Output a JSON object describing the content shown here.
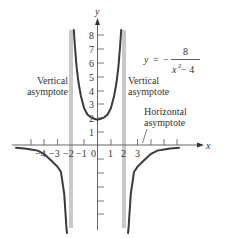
{
  "figure": {
    "equation": {
      "lhs": "y",
      "equals": "=",
      "sign": "−",
      "numerator": "8",
      "denominator_base": "x",
      "denominator_exp": "2",
      "denominator_rest": " − 4"
    },
    "axes": {
      "x_label": "x",
      "y_label": "y",
      "x_ticks": [
        "−4",
        "−3",
        "−2",
        "−1",
        "0",
        "1",
        "2",
        "3",
        "4"
      ],
      "y_ticks": [
        "1",
        "2",
        "3",
        "4",
        "5",
        "6",
        "7",
        "8"
      ]
    },
    "annotations": {
      "left_vertical": [
        "Vertical",
        "asymptote"
      ],
      "right_vertical": [
        "Vertical",
        "asymptote"
      ],
      "horizontal": [
        "Horizontal",
        "asymptote"
      ]
    },
    "colors": {
      "curve": "#3a3a3a",
      "axis": "#555555",
      "asymptote": "#666666",
      "text": "#333333"
    }
  }
}
